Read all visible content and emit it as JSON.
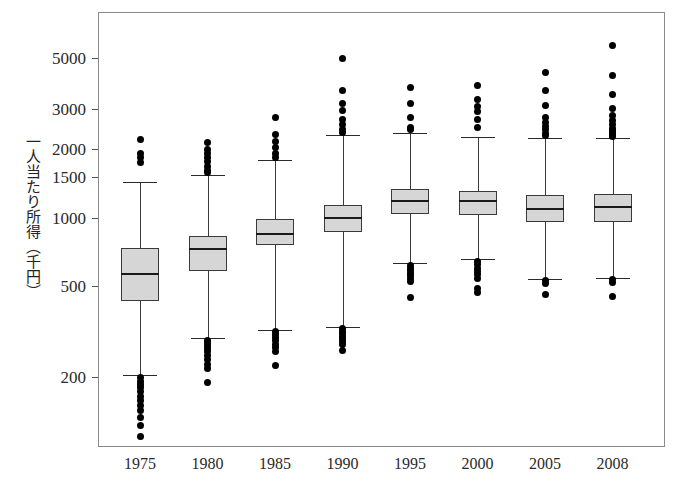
{
  "figure": {
    "ylabel": "一人当たり所得（千円）",
    "xlabel": ""
  },
  "chart_data": {
    "type": "box",
    "title": "",
    "xlabel": "",
    "ylabel": "一人当たり所得（千円）",
    "yscale": "log",
    "ylim": [
      100,
      6200
    ],
    "grid": false,
    "legend": "none",
    "yticks": [
      5000,
      3000,
      2000,
      1500,
      1000,
      500,
      200
    ],
    "ytick_labels": [
      "5000",
      "3000",
      "2000",
      "1500",
      "1000",
      "500",
      "200"
    ],
    "categories": [
      "1975",
      "1980",
      "1985",
      "1990",
      "1995",
      "2000",
      "2005",
      "2008"
    ],
    "boxes": [
      {
        "category": "1975",
        "whisker_low": 205,
        "q1": 430,
        "median": 565,
        "q3": 735,
        "whisker_high": 1430,
        "outliers_high": [
          2200,
          1900,
          1830,
          1750
        ],
        "outliers_low": [
          198,
          192,
          186,
          180,
          172,
          165,
          158,
          150,
          143,
          133,
          122,
          110
        ]
      },
      {
        "category": "1980",
        "whisker_low": 295,
        "q1": 580,
        "median": 725,
        "q3": 830,
        "whisker_high": 1530,
        "outliers_high": [
          2130,
          1980,
          1900,
          1840,
          1760,
          1670,
          1600,
          1570
        ],
        "outliers_low": [
          290,
          282,
          275,
          267,
          258,
          248,
          238,
          228,
          218,
          190
        ]
      },
      {
        "category": "1985",
        "whisker_low": 320,
        "q1": 755,
        "median": 850,
        "q3": 985,
        "whisker_high": 1780,
        "outliers_high": [
          2750,
          2300,
          2150,
          2020,
          1900,
          1840
        ],
        "outliers_low": [
          318,
          308,
          298,
          288,
          278,
          268,
          258,
          225
        ]
      },
      {
        "category": "1990",
        "whisker_low": 330,
        "q1": 860,
        "median": 1000,
        "q3": 1140,
        "whisker_high": 2300,
        "outliers_high": [
          4950,
          3600,
          3150,
          2950,
          2700,
          2550,
          2440,
          2360
        ],
        "outliers_low": [
          325,
          318,
          310,
          302,
          294,
          286,
          278,
          262
        ]
      },
      {
        "category": "1995",
        "whisker_low": 630,
        "q1": 1040,
        "median": 1185,
        "q3": 1330,
        "whisker_high": 2350,
        "outliers_high": [
          3700,
          3150,
          2750,
          2480,
          2420
        ],
        "outliers_low": [
          615,
          600,
          585,
          570,
          555,
          540,
          525,
          445
        ]
      },
      {
        "category": "2000",
        "whisker_low": 660,
        "q1": 1030,
        "median": 1180,
        "q3": 1310,
        "whisker_high": 2250,
        "outliers_high": [
          3800,
          3300,
          3050,
          2900,
          2700,
          2480
        ],
        "outliers_low": [
          640,
          620,
          600,
          580,
          560,
          540,
          490,
          470
        ]
      },
      {
        "category": "2005",
        "whisker_low": 540,
        "q1": 960,
        "median": 1090,
        "q3": 1250,
        "whisker_high": 2230,
        "outliers_high": [
          4300,
          3600,
          3100,
          2750,
          2620,
          2500,
          2420,
          2330,
          2280
        ],
        "outliers_low": [
          530,
          515,
          460
        ]
      },
      {
        "category": "2008",
        "whisker_low": 545,
        "q1": 960,
        "median": 1115,
        "q3": 1270,
        "whisker_high": 2220,
        "outliers_high": [
          5700,
          4200,
          3450,
          3000,
          2800,
          2650,
          2550,
          2460,
          2400,
          2350,
          2300,
          2260
        ],
        "outliers_low": [
          535,
          520,
          450
        ]
      }
    ]
  }
}
